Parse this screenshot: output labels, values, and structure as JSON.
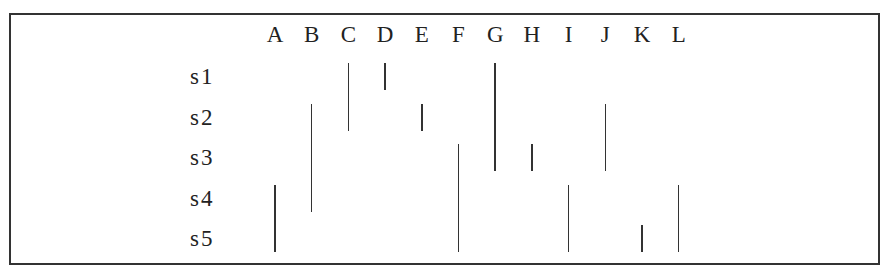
{
  "columns": [
    "A",
    "B",
    "C",
    "D",
    "E",
    "F",
    "G",
    "H",
    "I",
    "J",
    "K",
    "L"
  ],
  "rows": [
    "s1",
    "s2",
    "s3",
    "s4",
    "s5"
  ],
  "chart_data": {
    "type": "table",
    "title": "",
    "columns": [
      "A",
      "B",
      "C",
      "D",
      "E",
      "F",
      "G",
      "H",
      "I",
      "J",
      "K",
      "L"
    ],
    "rows": [
      "s1",
      "s2",
      "s3",
      "s4",
      "s5"
    ],
    "intervals": [
      {
        "column": "C",
        "from": "s1",
        "to": "s2"
      },
      {
        "column": "D",
        "from": "s1",
        "to": "s1"
      },
      {
        "column": "G",
        "from": "s1",
        "to": "s3"
      },
      {
        "column": "B",
        "from": "s2",
        "to": "s4"
      },
      {
        "column": "E",
        "from": "s2",
        "to": "s2"
      },
      {
        "column": "J",
        "from": "s2",
        "to": "s3"
      },
      {
        "column": "F",
        "from": "s3",
        "to": "s5"
      },
      {
        "column": "H",
        "from": "s3",
        "to": "s3"
      },
      {
        "column": "A",
        "from": "s4",
        "to": "s5"
      },
      {
        "column": "I",
        "from": "s4",
        "to": "s5"
      },
      {
        "column": "L",
        "from": "s4",
        "to": "s5"
      },
      {
        "column": "K",
        "from": "s5",
        "to": "s5"
      }
    ]
  }
}
